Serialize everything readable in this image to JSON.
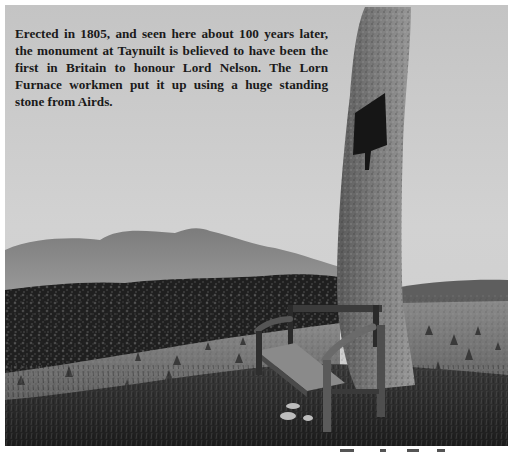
{
  "photo": {
    "description": "Black-and-white photograph of a tall standing stone monument with a wooden bench, a hill in the background, a forest and a field of haystacks",
    "tone": "monochrome",
    "colors": {
      "sky": "#cfcfcf",
      "hill": "#8a8a8a",
      "forest": "#1e1e1e",
      "field": "#6b6b6b",
      "stone": "#7a7a7a",
      "grass_foreground": "#2a2a2a"
    },
    "caption": "Erected in 1805, and seen here about 100 years later, the monument at Taynuilt is believed to have been the first in Britain to honour Lord Nelson. The Lorn Furnace workmen put it up using a huge standing stone from Airds."
  }
}
